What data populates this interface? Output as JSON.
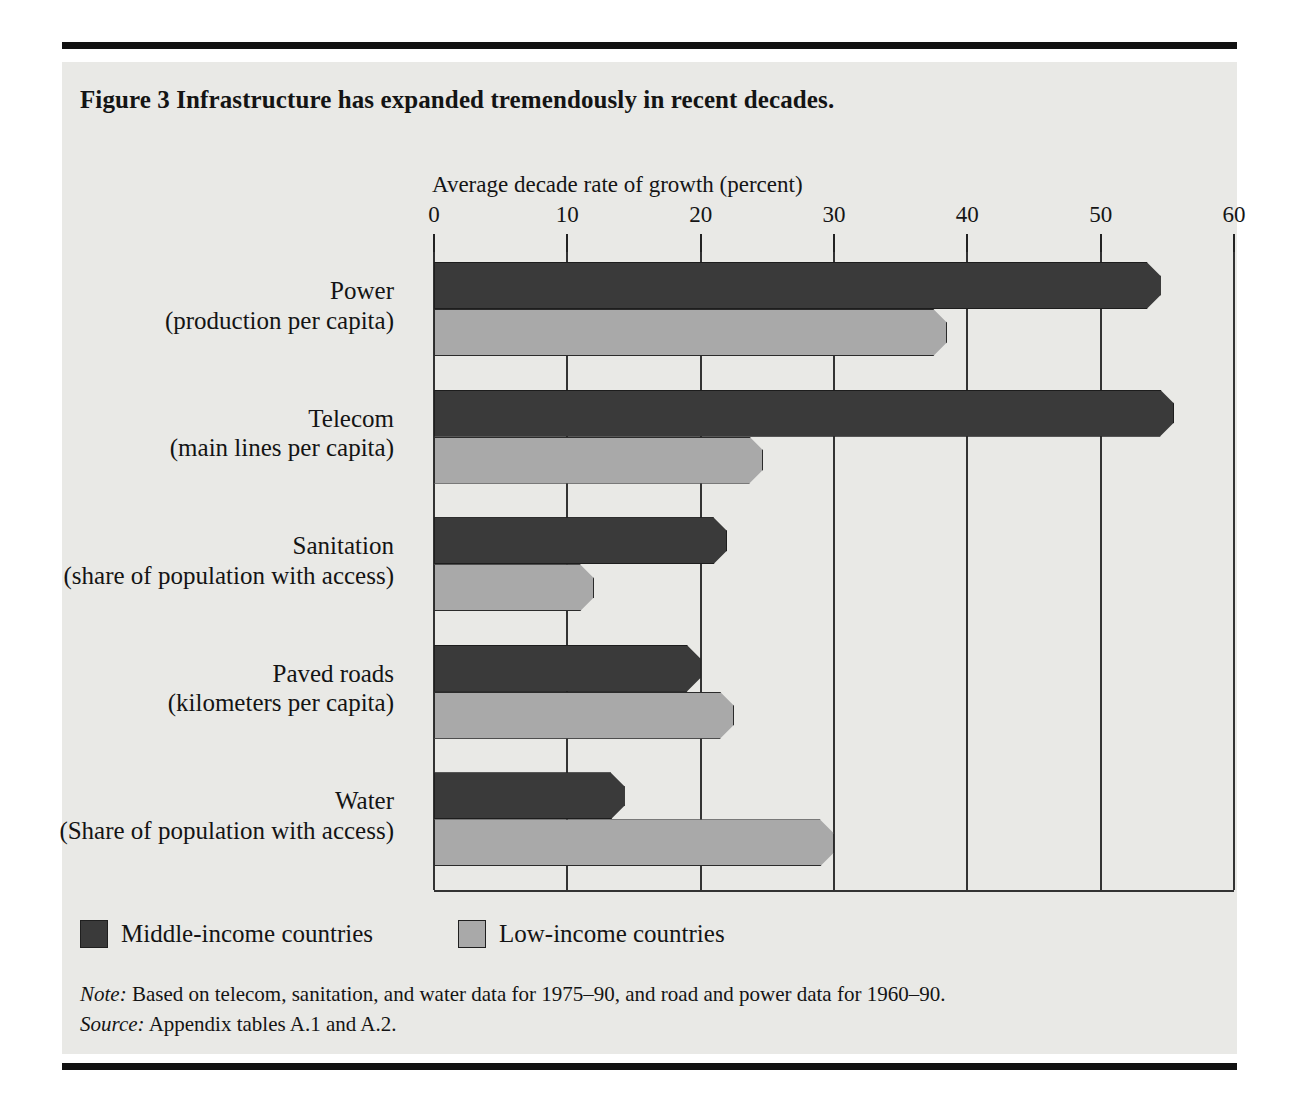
{
  "figure": {
    "title": "Figure 3  Infrastructure has expanded tremendously in recent decades."
  },
  "legend": {
    "items": [
      {
        "key": "middle",
        "label": "Middle-income countries",
        "color": "#3a3a3a"
      },
      {
        "key": "low",
        "label": "Low-income countries",
        "color": "#a9a9a9"
      }
    ]
  },
  "notes": {
    "note_lead": "Note:",
    "note_text": "Based on telecom, sanitation, and water data for 1975–90, and road and power data for 1960–90.",
    "source_lead": "Source:",
    "source_text": "Appendix tables A.1 and A.2."
  },
  "chart_data": {
    "type": "bar",
    "orientation": "horizontal",
    "title": "Figure 3  Infrastructure has expanded tremendously in recent decades.",
    "xlabel": "Average decade rate of growth (percent)",
    "ylabel": "",
    "xlim": [
      0,
      60
    ],
    "xticks": [
      0,
      10,
      20,
      30,
      40,
      50,
      60
    ],
    "xticklabels": [
      "0",
      "10",
      "20",
      "30",
      "40",
      "50",
      "60"
    ],
    "grid": "vertical",
    "legend_position": "below-plot-left",
    "categories": [
      "Power (production per capita)",
      "Telecom (main lines per capita)",
      "Sanitation (share of population with access)",
      "Paved roads (kilometers per capita)",
      "Water (Share of population with access)"
    ],
    "category_parts": [
      {
        "name": "Power",
        "unit": "(production per capita)"
      },
      {
        "name": "Telecom",
        "unit": "(main lines per capita)"
      },
      {
        "name": "Sanitation",
        "unit": "(share of population with access)"
      },
      {
        "name": "Paved roads",
        "unit": "(kilometers per capita)"
      },
      {
        "name": "Water",
        "unit": "(Share of population with access)"
      }
    ],
    "series": [
      {
        "name": "Middle-income countries",
        "color": "#3a3a3a",
        "values": [
          54.5,
          55.5,
          22.0,
          20.0,
          14.3
        ]
      },
      {
        "name": "Low-income countries",
        "color": "#a9a9a9",
        "values": [
          38.5,
          24.7,
          12.0,
          22.5,
          30.0
        ]
      }
    ]
  }
}
